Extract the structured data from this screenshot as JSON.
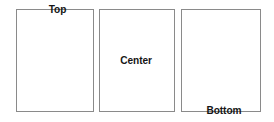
{
  "canvas": {
    "width": 274,
    "height": 122,
    "background_color": "#ffffff"
  },
  "style": {
    "box_border_color": "#8a8a8a",
    "box_fill_color": "#ffffff",
    "label_color": "#151515"
  },
  "boxes": [
    {
      "id": "top",
      "label": "Top",
      "vertical_alignment": "top",
      "horizontal_alignment": "center",
      "x": 16,
      "y": 9,
      "width": 78,
      "height": 103
    },
    {
      "id": "center",
      "label": "Center",
      "vertical_alignment": "center",
      "horizontal_alignment": "center",
      "x": 99,
      "y": 9,
      "width": 76,
      "height": 103
    },
    {
      "id": "bottom",
      "label": "Bottom",
      "vertical_alignment": "bottom",
      "horizontal_alignment": "center",
      "x": 181,
      "y": 9,
      "width": 80,
      "height": 103
    }
  ]
}
